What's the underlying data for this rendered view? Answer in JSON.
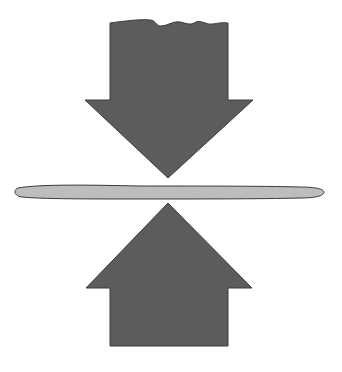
{
  "diagram": {
    "elements": [
      {
        "id": "down-arrow",
        "direction": "down",
        "color": "#5c5c5c"
      },
      {
        "id": "center-bar",
        "shape": "thin elongated ellipse",
        "color": "#b9b9b9",
        "outline": "#3a3a3a"
      },
      {
        "id": "up-arrow",
        "direction": "up",
        "color": "#5c5c5c"
      }
    ],
    "colors": {
      "arrow_fill": "#5c5c5c",
      "arrow_stroke": "#3c3c3c",
      "bar_fill": "#bdbdbd",
      "bar_stroke": "#3a3a3a",
      "background": "#ffffff"
    }
  }
}
